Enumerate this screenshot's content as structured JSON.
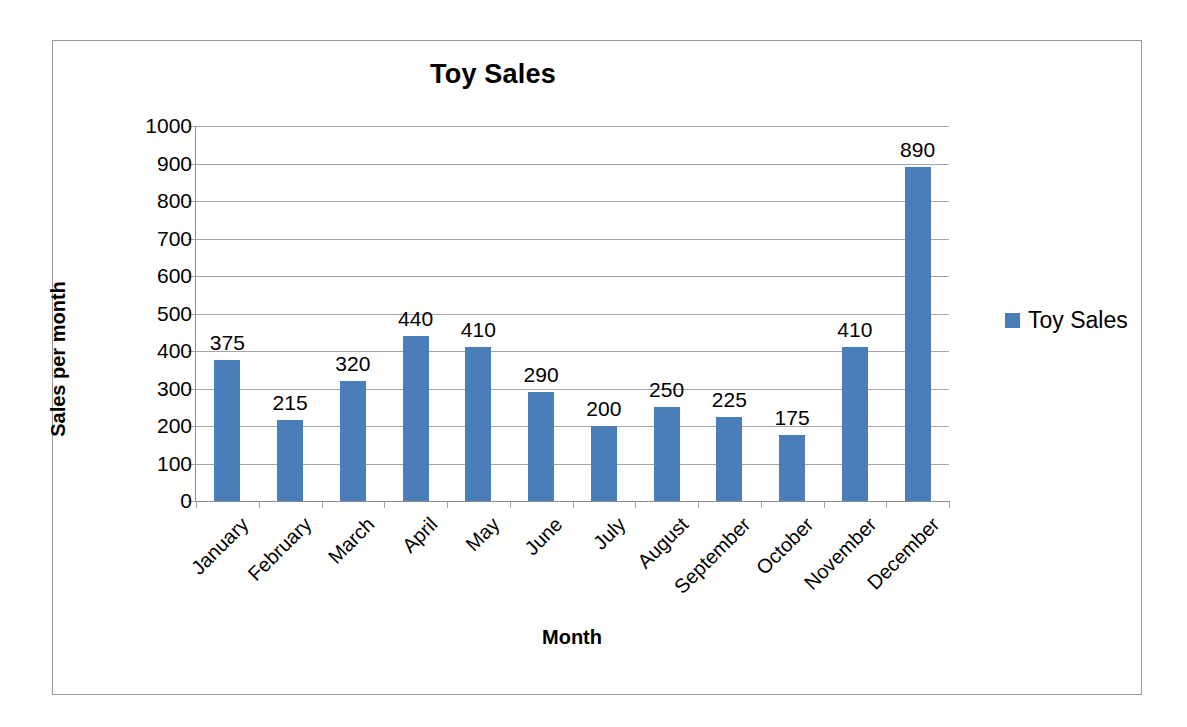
{
  "chart_data": {
    "type": "bar",
    "title": "Toy Sales",
    "xlabel": "Month",
    "ylabel": "Sales per month",
    "categories": [
      "January",
      "February",
      "March",
      "April",
      "May",
      "June",
      "July",
      "August",
      "September",
      "October",
      "November",
      "December"
    ],
    "values": [
      375,
      215,
      320,
      440,
      410,
      290,
      200,
      250,
      225,
      175,
      410,
      890
    ],
    "series": [
      {
        "name": "Toy Sales",
        "values": [
          375,
          215,
          320,
          440,
          410,
          290,
          200,
          250,
          225,
          175,
          410,
          890
        ]
      }
    ],
    "data_labels": [
      "375",
      "215",
      "320",
      "440",
      "410",
      "290",
      "200",
      "250",
      "225",
      "175",
      "410",
      "890"
    ],
    "ylim": [
      0,
      1000
    ],
    "ytick_step": 100,
    "ytick_labels": [
      "1000",
      "900",
      "800",
      "700",
      "600",
      "500",
      "400",
      "300",
      "200",
      "100",
      "0"
    ],
    "grid": true,
    "legend": {
      "position": "right",
      "entries": [
        "Toy Sales"
      ]
    },
    "colors": {
      "bar": "#4A7EBB",
      "gridline": "#A6A6A6",
      "axis": "#8C8C8C",
      "border": "#9A9A9A",
      "text": "#000000",
      "background": "#FFFFFF"
    }
  }
}
